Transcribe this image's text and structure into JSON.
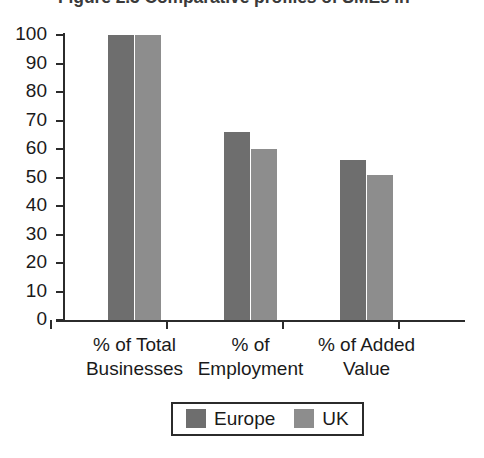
{
  "chart_data": {
    "type": "bar",
    "title": "Figure 2.3  Comparative profiles of SMEs in",
    "xlabel": "",
    "ylabel": "",
    "ylim": [
      0,
      100
    ],
    "ytick_step": 10,
    "yticks": [
      "100",
      "90",
      "80",
      "70",
      "60",
      "50",
      "40",
      "30",
      "20",
      "10",
      "0"
    ],
    "grid": false,
    "legend_position": "bottom-center",
    "categories": [
      "% of Total\nBusinesses",
      "% of\nEmployment",
      "% of Added\nValue"
    ],
    "category_lines": [
      [
        "% of Total",
        "Businesses"
      ],
      [
        "% of",
        "Employment"
      ],
      [
        "% of Added",
        "Value"
      ]
    ],
    "series": [
      {
        "name": "Europe",
        "color": "#6e6e6e",
        "values": [
          100,
          66,
          56
        ]
      },
      {
        "name": "UK",
        "color": "#8d8d8d",
        "values": [
          100,
          60,
          51
        ]
      }
    ]
  },
  "legend": {
    "entries": [
      {
        "label": "Europe"
      },
      {
        "label": "UK"
      }
    ]
  }
}
